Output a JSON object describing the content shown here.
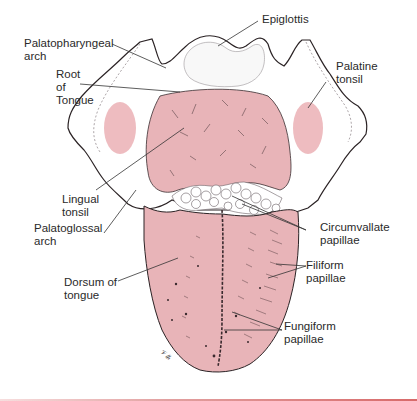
{
  "figure": {
    "colors": {
      "tongue_pink": "#e8b4b8",
      "tonsil_pink": "#eebcc0",
      "outline": "#2b2325",
      "leader_line": "#333333",
      "rule": "#d86a6a"
    },
    "labels": [
      {
        "id": "epiglottis",
        "text": "Epiglottis"
      },
      {
        "id": "palatopharyngeal-arch",
        "text": "Palatopharyngeal\narch"
      },
      {
        "id": "root-of-tongue",
        "text": "Root\nof\nTongue"
      },
      {
        "id": "palatine-tonsil",
        "text": "Palatine\ntonsil"
      },
      {
        "id": "lingual-tonsil",
        "text": "Lingual\ntonsil"
      },
      {
        "id": "palatoglossal-arch",
        "text": "Palatoglossal\narch"
      },
      {
        "id": "circumvallate-papillae",
        "text": "Circumvallate\npapillae"
      },
      {
        "id": "dorsum-of-tongue",
        "text": "Dorsum of\ntongue"
      },
      {
        "id": "filiform-papillae",
        "text": "Filiform\npapillae"
      },
      {
        "id": "fungiform-papillae",
        "text": "Fungiform\npapillae"
      }
    ],
    "artist_signature": "𝒱𝓁𝒽"
  }
}
